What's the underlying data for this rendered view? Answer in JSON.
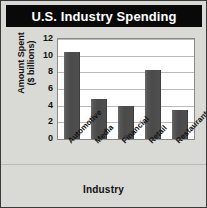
{
  "chart_data": {
    "type": "bar",
    "title": "U.S. Industry Spending",
    "xlabel": "Industry",
    "ylabel_line1": "Amount Spent",
    "ylabel_line2": "($ billions)",
    "ylabel": "Amount Spent ($ billions)",
    "categories": [
      "Automotive",
      "Media",
      "Financial",
      "Retail",
      "Restaurants"
    ],
    "values": [
      10.5,
      4.8,
      4.0,
      8.3,
      3.5
    ],
    "yticks": [
      12,
      10,
      8,
      6,
      4,
      2,
      0
    ],
    "ylim": [
      0,
      12
    ],
    "grid": true,
    "legend": false,
    "orientation": "vertical",
    "xtick_rotation": -45,
    "colors": {
      "bar": "#4a4a4a",
      "bar_highlight": "#6b6b6b",
      "plot_background": "#ffffff",
      "gridline": "#b9b9b9",
      "figure_background": "#d9d9d5",
      "title_background": "#090909",
      "title_text": "#ffffff",
      "axis_text": "#111111",
      "frame": "#8a8a8a"
    }
  }
}
